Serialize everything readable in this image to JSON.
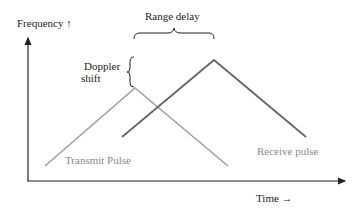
{
  "axes": {
    "y_label": "Frequency ↑",
    "x_label": "Time →"
  },
  "annotations": {
    "range_delay": "Range delay",
    "doppler_shift_line1": "Doppler",
    "doppler_shift_line2": "shift"
  },
  "series": [
    {
      "name": "Transmit Pulse",
      "color": "#9a9a9a",
      "points": [
        [
          45,
          166
        ],
        [
          135,
          88
        ],
        [
          228,
          166
        ]
      ]
    },
    {
      "name": "Receive pulse",
      "color": "#555555",
      "points": [
        [
          122,
          137
        ],
        [
          214,
          60
        ],
        [
          306,
          137
        ]
      ]
    }
  ],
  "legend": {
    "transmit": "Transmit Pulse",
    "receive": "Receive pulse"
  }
}
